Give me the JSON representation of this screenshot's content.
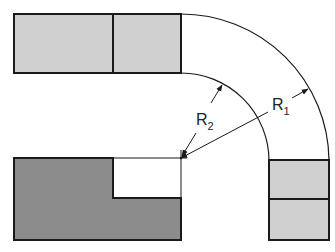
{
  "diagram": {
    "type": "bend-radius-illustration",
    "colors": {
      "background": "#ffffff",
      "stroke": "#1a1a1a",
      "light_fill": "#d0d0d0",
      "dark_fill": "#8c8c8c"
    },
    "labels": {
      "outer_radius": {
        "main": "R",
        "sub": "1"
      },
      "inner_radius": {
        "main": "R",
        "sub": "2"
      }
    },
    "shapes": {
      "top_block": "Horizontal light-gray block split into two segments",
      "bottom_left_block": "Dark-gray L-shaped notched block",
      "right_block": "Vertical light-gray block split into two segments",
      "outer_arc": "Quarter arc of radius R1",
      "inner_arc": "Quarter arc of radius R2",
      "center_mark": "Center point of both arcs"
    }
  }
}
